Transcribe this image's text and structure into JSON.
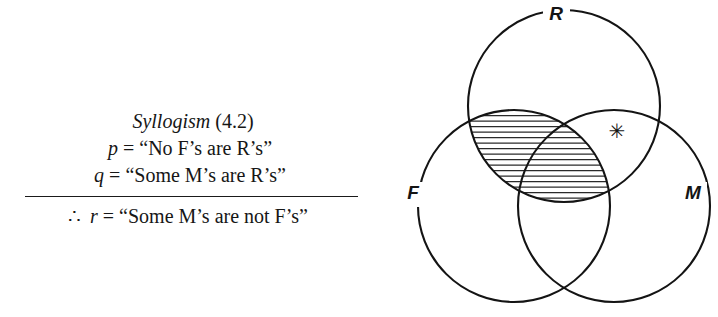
{
  "figure": {
    "kind": "venn-syllogism-figure"
  },
  "syllogism": {
    "title_word": "Syllogism",
    "title_number": "(4.2)",
    "premise1": {
      "symbol": "p",
      "equals": "=",
      "statement": "“No F’s are R’s”",
      "statement_plain": "No F's are R's"
    },
    "premise2": {
      "symbol": "q",
      "equals": "=",
      "statement": "“Some M’s are R’s”",
      "statement_plain": "Some M's are R's"
    },
    "conclusion": {
      "therefore_symbol": "∴",
      "symbol": "r",
      "equals": "=",
      "statement": "“Some M’s are not F’s”",
      "statement_plain": "Some M's are not F's"
    },
    "divider": "horizontal-rule"
  },
  "venn": {
    "circles": [
      {
        "id": "R",
        "label": "R",
        "cx": 184,
        "cy": 106,
        "r": 96,
        "label_x": 176,
        "label_y": 20
      },
      {
        "id": "F",
        "label": "F",
        "cx": 134,
        "cy": 206,
        "r": 96,
        "label_x": 33,
        "label_y": 199
      },
      {
        "id": "M",
        "label": "M",
        "cx": 234,
        "cy": 206,
        "r": 96,
        "label_x": 313,
        "label_y": 199
      }
    ],
    "shaded_region": {
      "name": "F-intersect-R",
      "description": "horizontal hatching over the entire F ∩ R lens including the triple overlap",
      "pattern": "horizontal-lines",
      "line_spacing_px": 5.5
    },
    "marker": {
      "glyph": "✳",
      "name": "asterisk-marker",
      "region": "R-intersect-M-only",
      "x": 237,
      "y": 138
    },
    "label_gap_degrees": 26,
    "stroke_color": "#141414"
  }
}
